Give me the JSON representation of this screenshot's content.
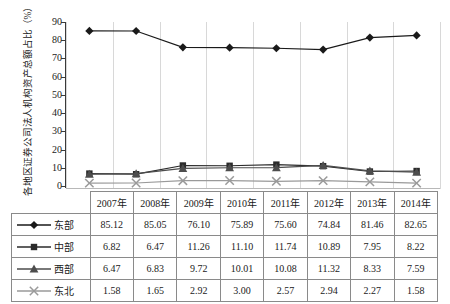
{
  "chart_data": {
    "type": "line",
    "title": "",
    "subtitle": "",
    "xlabel": "",
    "ylabel": "各地区证券公司法人机构资产总额占比（%）",
    "ylim": [
      0,
      90
    ],
    "yticks": [
      0,
      10,
      20,
      30,
      40,
      50,
      60,
      70,
      80,
      90
    ],
    "grid": false,
    "legend_position": "table-row-headers",
    "categories": [
      "2007年",
      "2008年",
      "2009年",
      "2010年",
      "2011年",
      "2012年",
      "2013年",
      "2014年"
    ],
    "series": [
      {
        "name": "东部",
        "marker": "diamond",
        "color": "#1a1a1a",
        "values": [
          85.12,
          85.05,
          76.1,
          75.89,
          75.6,
          74.84,
          81.46,
          82.65
        ]
      },
      {
        "name": "中部",
        "marker": "square",
        "color": "#2b2b2b",
        "values": [
          6.82,
          6.47,
          11.26,
          11.1,
          11.74,
          10.89,
          7.95,
          8.22
        ]
      },
      {
        "name": "西部",
        "marker": "triangle",
        "color": "#4d4d4d",
        "values": [
          6.47,
          6.83,
          9.72,
          10.01,
          10.08,
          11.32,
          8.33,
          7.59
        ]
      },
      {
        "name": "东北",
        "marker": "cross",
        "color": "#9a9a9a",
        "values": [
          1.58,
          1.65,
          2.92,
          3.0,
          2.57,
          2.94,
          2.27,
          1.58
        ]
      }
    ]
  },
  "table": {
    "corner_label": "",
    "column_headers": [
      "2007年",
      "2008年",
      "2009年",
      "2010年",
      "2011年",
      "2012年",
      "2013年",
      "2014年"
    ],
    "rows": [
      {
        "label": "东部",
        "values": [
          "85.12",
          "85.05",
          "76.10",
          "75.89",
          "75.60",
          "74.84",
          "81.46",
          "82.65"
        ]
      },
      {
        "label": "中部",
        "values": [
          "6.82",
          "6.47",
          "11.26",
          "11.10",
          "11.74",
          "10.89",
          "7.95",
          "8.22"
        ]
      },
      {
        "label": "西部",
        "values": [
          "6.47",
          "6.83",
          "9.72",
          "10.01",
          "10.08",
          "11.32",
          "8.33",
          "7.59"
        ]
      },
      {
        "label": "东北",
        "values": [
          "1.58",
          "1.65",
          "2.92",
          "3.00",
          "2.57",
          "2.94",
          "2.27",
          "1.58"
        ]
      }
    ]
  },
  "axis": {
    "y_tick_labels": [
      "90",
      "80",
      "70",
      "60",
      "50",
      "40",
      "30",
      "20",
      "10",
      "0"
    ]
  },
  "colors": {
    "axis": "#3a3a3a",
    "grid": "#d8d8d8",
    "table_border": "#8a8a8a",
    "text": "#1a1a1a"
  }
}
